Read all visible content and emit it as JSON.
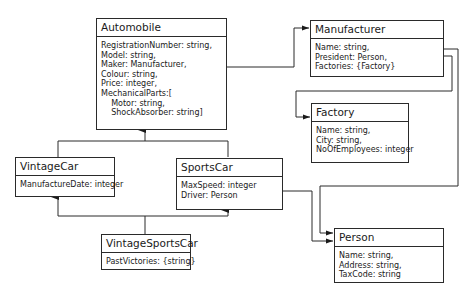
{
  "diagram": {
    "type": "UML class diagram",
    "classes": {
      "automobile": {
        "name": "Automobile",
        "attributes": "RegistrationNumber: string,\nModel: string,\nMaker: Manufacturer,\nColour: string,\nPrice: integer,\nMechanicalParts:[\n    Motor: string,\n    ShockAbsorber: string]"
      },
      "manufacturer": {
        "name": "Manufacturer",
        "attributes": "Name: string,\nPresident: Person,\nFactories: {Factory}"
      },
      "factory": {
        "name": "Factory",
        "attributes": "Name: string,\nCity: string,\nNoOfEmployees: integer"
      },
      "vintage_car": {
        "name": "VintageCar",
        "attributes": "ManufactureDate: integer"
      },
      "sports_car": {
        "name": "SportsCar",
        "attributes": "MaxSpeed: integer\nDriver: Person"
      },
      "vintage_sports_car": {
        "name": "VintageSportsCar",
        "attributes": "PastVictories: {string}"
      },
      "person": {
        "name": "Person",
        "attributes": "Name: string,\nAddress: string,\nTaxCode: string"
      }
    },
    "relations": [
      {
        "from": "Automobile",
        "to": "Manufacturer",
        "kind": "reference"
      },
      {
        "from": "Manufacturer",
        "to": "Factory",
        "kind": "reference"
      },
      {
        "from": "Manufacturer",
        "to": "Person",
        "kind": "reference"
      },
      {
        "from": "SportsCar",
        "to": "Person",
        "kind": "reference"
      },
      {
        "from": "VintageCar",
        "to": "Automobile",
        "kind": "generalization"
      },
      {
        "from": "SportsCar",
        "to": "Automobile",
        "kind": "generalization"
      },
      {
        "from": "VintageSportsCar",
        "to": "VintageCar",
        "kind": "generalization"
      },
      {
        "from": "VintageSportsCar",
        "to": "SportsCar",
        "kind": "generalization"
      }
    ],
    "colors": {
      "line": "#2a2a2a",
      "background": "#ffffff"
    }
  }
}
